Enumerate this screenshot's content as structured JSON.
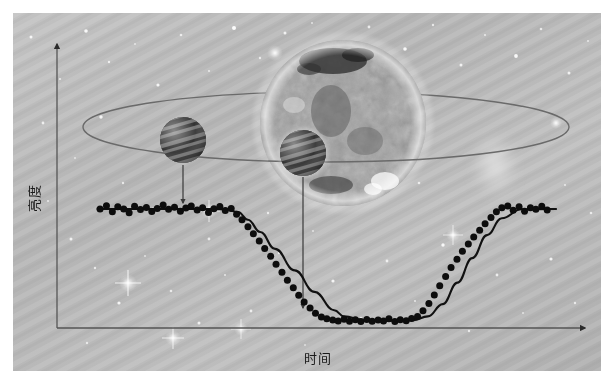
{
  "figure": {
    "title": "",
    "y_axis_label": "亮度",
    "x_axis_label": "时间",
    "background_description": "starfield",
    "colors": {
      "axis": "#5b5b5b",
      "data_point": "#0d0d0d",
      "fit_curve": "#111111",
      "orbit": "#6a6a6a",
      "pointer_arrow": "#444444",
      "star_body": "#9a9a9a",
      "planet_body": "#3c3c3c"
    }
  },
  "axes": {
    "origin": {
      "x": 44,
      "y": 315
    },
    "y_arrow_tip": {
      "x": 44,
      "y": 27
    },
    "x_arrow_tip": {
      "x": 578,
      "y": 315
    }
  },
  "illustration": {
    "star": {
      "cx": 330,
      "cy": 110,
      "r": 83,
      "name": "star"
    },
    "orbit": {
      "cx": 313,
      "cy": 114,
      "rx": 243,
      "ry": 35
    },
    "planets": [
      {
        "name": "planet-outside-transit",
        "cx": 170,
        "cy": 127,
        "r": 23
      },
      {
        "name": "planet-in-transit",
        "cx": 290,
        "cy": 140,
        "r": 23
      }
    ],
    "pointers": [
      {
        "name": "pointer-baseline",
        "from": {
          "x": 170,
          "y": 152
        },
        "to": {
          "x": 170,
          "y": 192
        }
      },
      {
        "name": "pointer-transit-floor",
        "from": {
          "x": 290,
          "y": 163
        },
        "to": {
          "x": 290,
          "y": 297
        }
      }
    ]
  },
  "chart_data": {
    "type": "scatter",
    "title": "",
    "xlabel": "时间",
    "ylabel": "亮度",
    "grid": false,
    "legend": null,
    "xlim": [
      0,
      1
    ],
    "ylim": [
      0,
      1
    ],
    "annotations": [
      "arrow from non-transiting planet to out-of-transit baseline",
      "arrow from transiting planet to in-transit flux floor"
    ],
    "series": [
      {
        "name": "observed-flux",
        "marker": "filled-circle",
        "x": [
          0.065,
          0.078,
          0.09,
          0.101,
          0.113,
          0.124,
          0.135,
          0.147,
          0.159,
          0.17,
          0.181,
          0.193,
          0.204,
          0.216,
          0.228,
          0.239,
          0.25,
          0.262,
          0.273,
          0.285,
          0.296,
          0.308,
          0.319,
          0.331,
          0.342,
          0.353,
          0.365,
          0.376,
          0.388,
          0.399,
          0.411,
          0.422,
          0.434,
          0.445,
          0.457,
          0.468,
          0.479,
          0.491,
          0.502,
          0.514,
          0.525,
          0.537,
          0.548,
          0.56,
          0.571,
          0.583,
          0.594,
          0.606,
          0.617,
          0.629,
          0.64,
          0.651,
          0.663,
          0.674,
          0.686,
          0.697,
          0.709,
          0.72,
          0.732,
          0.743,
          0.754,
          0.766,
          0.777,
          0.789,
          0.8,
          0.812,
          0.823,
          0.835,
          0.846,
          0.858,
          0.869,
          0.88,
          0.892,
          0.903,
          0.915,
          0.926,
          0.938,
          0.949,
          0.961,
          0.972
        ],
        "y": [
          1.0,
          1.021,
          0.982,
          1.014,
          1.0,
          0.975,
          1.018,
          0.996,
          1.01,
          0.984,
          1.004,
          1.026,
          0.998,
          1.012,
          0.986,
          1.006,
          1.02,
          0.994,
          1.008,
          0.978,
          1.002,
          1.016,
          0.99,
          1.004,
          0.966,
          0.93,
          0.884,
          0.838,
          0.792,
          0.742,
          0.692,
          0.64,
          0.588,
          0.536,
          0.486,
          0.438,
          0.394,
          0.354,
          0.32,
          0.296,
          0.284,
          0.276,
          0.27,
          0.282,
          0.268,
          0.278,
          0.266,
          0.28,
          0.268,
          0.276,
          0.27,
          0.284,
          0.266,
          0.278,
          0.272,
          0.286,
          0.3,
          0.336,
          0.384,
          0.44,
          0.5,
          0.56,
          0.618,
          0.672,
          0.724,
          0.772,
          0.818,
          0.862,
          0.904,
          0.944,
          0.982,
          1.008,
          1.02,
          0.992,
          1.014,
          0.986,
          1.008,
          0.998,
          1.018,
          0.994
        ]
      },
      {
        "name": "model-fit",
        "marker": "line",
        "x": [
          0.06,
          0.15,
          0.25,
          0.32,
          0.345,
          0.365,
          0.39,
          0.42,
          0.46,
          0.5,
          0.54,
          0.56,
          0.6,
          0.66,
          0.7,
          0.73,
          0.76,
          0.79,
          0.82,
          0.85,
          0.88,
          0.92,
          0.99
        ],
        "y": [
          1.0,
          1.0,
          1.0,
          0.998,
          0.98,
          0.93,
          0.85,
          0.74,
          0.6,
          0.46,
          0.34,
          0.3,
          0.276,
          0.272,
          0.276,
          0.3,
          0.38,
          0.52,
          0.68,
          0.83,
          0.94,
          0.998,
          1.0
        ]
      }
    ]
  }
}
